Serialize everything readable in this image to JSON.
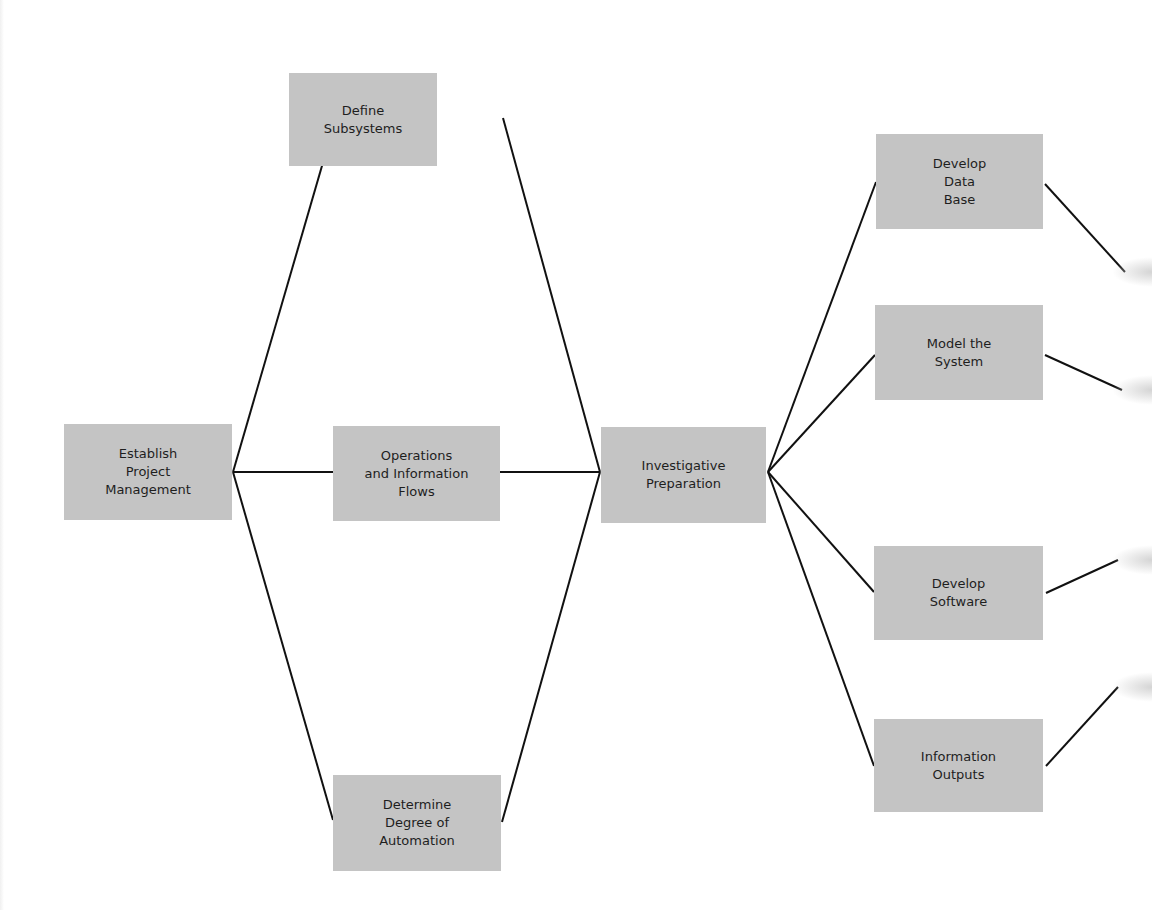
{
  "diagram": {
    "type": "network-flowchart",
    "colors": {
      "node_fill": "#c4c4c4",
      "line": "#111111",
      "text": "#1e1e1e",
      "background": "#ffffff"
    },
    "nodes": [
      {
        "id": "establish",
        "label": "Establish\nProject\nManagement",
        "x": 64,
        "y": 424,
        "w": 168,
        "h": 96
      },
      {
        "id": "define",
        "label": "Define\nSubsystems",
        "x": 289,
        "y": 73,
        "w": 148,
        "h": 93
      },
      {
        "id": "operations",
        "label": "Operations\nand Information\nFlows",
        "x": 333,
        "y": 426,
        "w": 167,
        "h": 95
      },
      {
        "id": "determine",
        "label": "Determine\nDegree of\nAutomation",
        "x": 333,
        "y": 775,
        "w": 168,
        "h": 96
      },
      {
        "id": "investigative",
        "label": "Investigative\nPreparation",
        "x": 601,
        "y": 427,
        "w": 165,
        "h": 96
      },
      {
        "id": "database",
        "label": "Develop\nData\nBase",
        "x": 876,
        "y": 134,
        "w": 167,
        "h": 95
      },
      {
        "id": "model",
        "label": "Model the\nSystem",
        "x": 875,
        "y": 305,
        "w": 168,
        "h": 95
      },
      {
        "id": "software",
        "label": "Develop\nSoftware",
        "x": 874,
        "y": 546,
        "w": 169,
        "h": 94
      },
      {
        "id": "outputs",
        "label": "Information\nOutputs",
        "x": 874,
        "y": 719,
        "w": 169,
        "h": 93
      }
    ],
    "edges": [
      {
        "from": "establish",
        "to": "define",
        "x1": 233,
        "y1": 472,
        "x2": 333,
        "y2": 128
      },
      {
        "from": "establish",
        "to": "operations",
        "x1": 233,
        "y1": 472,
        "x2": 333,
        "y2": 472
      },
      {
        "from": "establish",
        "to": "determine",
        "x1": 233,
        "y1": 472,
        "x2": 333,
        "y2": 820
      },
      {
        "from": "define",
        "to": "investigative",
        "x1": 503,
        "y1": 118,
        "x2": 600,
        "y2": 472
      },
      {
        "from": "operations",
        "to": "investigative",
        "x1": 500,
        "y1": 472,
        "x2": 600,
        "y2": 472
      },
      {
        "from": "determine",
        "to": "investigative",
        "x1": 502,
        "y1": 822,
        "x2": 600,
        "y2": 472
      },
      {
        "from": "investigative",
        "to": "database",
        "x1": 768,
        "y1": 472,
        "x2": 876,
        "y2": 182
      },
      {
        "from": "investigative",
        "to": "model",
        "x1": 768,
        "y1": 472,
        "x2": 875,
        "y2": 355
      },
      {
        "from": "investigative",
        "to": "software",
        "x1": 768,
        "y1": 472,
        "x2": 874,
        "y2": 592
      },
      {
        "from": "investigative",
        "to": "outputs",
        "x1": 768,
        "y1": 472,
        "x2": 874,
        "y2": 766
      },
      {
        "from": "database",
        "to": "offpage",
        "x1": 1045,
        "y1": 184,
        "x2": 1125,
        "y2": 272
      },
      {
        "from": "model",
        "to": "offpage",
        "x1": 1045,
        "y1": 355,
        "x2": 1122,
        "y2": 390
      },
      {
        "from": "software",
        "to": "offpage",
        "x1": 1046,
        "y1": 593,
        "x2": 1118,
        "y2": 560
      },
      {
        "from": "outputs",
        "to": "offpage",
        "x1": 1046,
        "y1": 766,
        "x2": 1118,
        "y2": 687
      }
    ]
  }
}
